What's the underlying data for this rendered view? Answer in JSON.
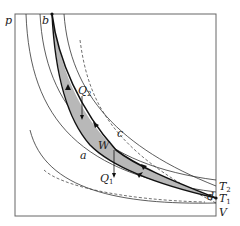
{
  "diagram": {
    "type": "pV thermodynamic cycle diagram",
    "axes": {
      "y_label": "p",
      "x_label": "V"
    },
    "points": {
      "a": "a",
      "b": "b",
      "c": "c",
      "d": "d"
    },
    "isotherms": {
      "T2": {
        "main": "T",
        "sub": "2"
      },
      "T1": {
        "main": "T",
        "sub": "1"
      }
    },
    "heat": {
      "Q2": {
        "main": "Q",
        "sub": "2"
      },
      "Q1": {
        "main": "Q",
        "sub": "1"
      }
    },
    "work_label": "W",
    "colors": {
      "line": "#222222",
      "fill": "#b8b8b8",
      "frame": "#555555"
    }
  }
}
